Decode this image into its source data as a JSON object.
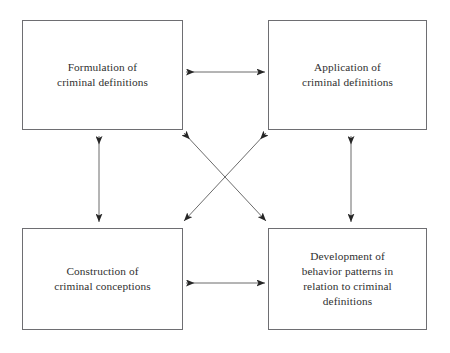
{
  "diagram": {
    "type": "flow-diagram",
    "title": "",
    "background_color": "#ffffff",
    "box_border_color": "#6e6e72",
    "text_color": "#2f2f30",
    "arrow_color": "#3a3a3a",
    "nodes": [
      {
        "id": "formulation",
        "position": "top-left",
        "label": "Formulation of\ncriminal definitions",
        "lines": [
          "Formulation of",
          "criminal definitions"
        ]
      },
      {
        "id": "application",
        "position": "top-right",
        "label": "Application of\ncriminal definitions",
        "lines": [
          "Application of",
          "criminal definitions"
        ]
      },
      {
        "id": "construction",
        "position": "bottom-left",
        "label": "Construction of\ncriminal conceptions",
        "lines": [
          "Construction of",
          "criminal conceptions"
        ]
      },
      {
        "id": "development",
        "position": "bottom-right",
        "label": "Development of\nbehavior patterns in\nrelation to criminal\ndefinitions",
        "lines": [
          "Development of",
          "behavior patterns in",
          "relation to criminal",
          "definitions"
        ]
      }
    ],
    "connectors": [
      {
        "id": "top-horizontal",
        "from": "formulation",
        "to": "application",
        "style": "double-headed-arrow",
        "orientation": "horizontal"
      },
      {
        "id": "left-vertical",
        "from": "formulation",
        "to": "construction",
        "style": "double-headed-arrow",
        "orientation": "vertical"
      },
      {
        "id": "right-vertical",
        "from": "application",
        "to": "development",
        "style": "double-headed-arrow",
        "orientation": "vertical"
      },
      {
        "id": "bottom-horizontal",
        "from": "construction",
        "to": "development",
        "style": "double-headed-arrow",
        "orientation": "horizontal"
      },
      {
        "id": "diagonal-formulation-development",
        "from": "formulation",
        "to": "development",
        "style": "double-headed-arrow",
        "orientation": "diagonal"
      },
      {
        "id": "diagonal-application-construction",
        "from": "application",
        "to": "construction",
        "style": "double-headed-arrow",
        "orientation": "diagonal"
      }
    ]
  }
}
